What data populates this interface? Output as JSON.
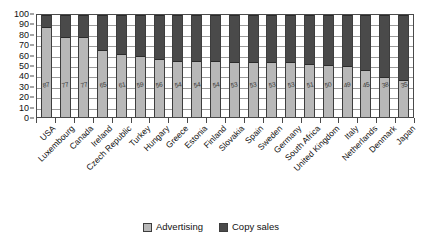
{
  "chart_data": {
    "type": "bar",
    "subtype": "stacked-percentage",
    "title": "",
    "xlabel": "",
    "ylabel": "",
    "ylim": [
      0,
      100
    ],
    "yticks": [
      100,
      90,
      80,
      70,
      60,
      50,
      40,
      30,
      20,
      10,
      0
    ],
    "grid": true,
    "legend_position": "bottom",
    "categories": [
      "USA",
      "Luxembourg",
      "Canada",
      "Ireland",
      "Czech Republic",
      "Turkey",
      "Hungary",
      "Greece",
      "Estonia",
      "Finland",
      "Slovakia",
      "Spain",
      "Sweden",
      "Germany",
      "South Africa",
      "United Kingdom",
      "Italy",
      "Netherlands",
      "Denmark",
      "Japan"
    ],
    "series": [
      {
        "name": "Advertising",
        "color": "#b8b8b8",
        "values": [
          87,
          77,
          77,
          65,
          61,
          59,
          56,
          54,
          54,
          54,
          53,
          53,
          53,
          53,
          51,
          50,
          49,
          45,
          38,
          35
        ]
      },
      {
        "name": "Copy sales",
        "color": "#4a4a4a",
        "values": [
          13,
          23,
          23,
          35,
          39,
          41,
          44,
          46,
          46,
          46,
          47,
          47,
          47,
          47,
          49,
          50,
          51,
          55,
          62,
          65
        ]
      }
    ],
    "data_labels": [
      "87",
      "77",
      "77",
      "65",
      "61",
      "59",
      "56",
      "54",
      "54",
      "54",
      "53",
      "53",
      "53",
      "53",
      "51",
      "50",
      "49",
      "45",
      "38",
      "35"
    ],
    "legend": [
      {
        "label": "Advertising",
        "color": "#b8b8b8"
      },
      {
        "label": "Copy sales",
        "color": "#4a4a4a"
      }
    ]
  }
}
